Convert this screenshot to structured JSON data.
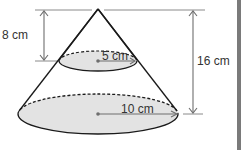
{
  "diagram": {
    "type": "cone-with-cross-section",
    "labels": {
      "top_height": "8 cm",
      "total_height": "16 cm",
      "small_radius": "5 cm",
      "large_radius": "10 cm"
    },
    "colors": {
      "line": "#1a1a1a",
      "dimension_line": "#6e6e6e",
      "fill": "#e3e3e3",
      "background": "#ffffff",
      "edge_strip": "#7a7a7a"
    }
  }
}
